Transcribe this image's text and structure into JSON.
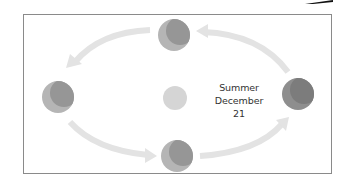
{
  "diagram": {
    "label": {
      "line1": "Summer",
      "line2": "December 21"
    },
    "colors": {
      "border": "#8a8a8a",
      "arrow": "#e3e3e3",
      "sun": "#d5d5d5",
      "planet_light": "#b5b5b5",
      "planet_dark": "#8e8e8e",
      "planet_darkest": "#7c7c7c",
      "text": "#333333"
    },
    "nodes": [
      {
        "name": "sun",
        "cx": 175,
        "cy": 98,
        "r": 12
      },
      {
        "name": "earth-top",
        "cx": 174,
        "cy": 35,
        "r": 16
      },
      {
        "name": "earth-left",
        "cx": 58,
        "cy": 97,
        "r": 16
      },
      {
        "name": "earth-bottom",
        "cx": 177,
        "cy": 156,
        "r": 16
      },
      {
        "name": "earth-right",
        "cx": 298,
        "cy": 94,
        "r": 16
      }
    ],
    "arrows": [
      {
        "name": "arrow-top-left",
        "direction": "counter-clockwise"
      },
      {
        "name": "arrow-top-right",
        "direction": "counter-clockwise"
      },
      {
        "name": "arrow-bottom-left",
        "direction": "counter-clockwise"
      },
      {
        "name": "arrow-bottom-right",
        "direction": "counter-clockwise"
      }
    ]
  }
}
